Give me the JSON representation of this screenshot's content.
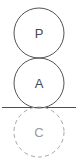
{
  "diagram": {
    "canvas": {
      "width": 78,
      "height": 166,
      "background": "#ffffff"
    },
    "ground_line": {
      "name": "ground-line",
      "x1": 2,
      "x2": 76,
      "y": 107,
      "color": "#4d4d4d",
      "style": "solid"
    },
    "circles": [
      {
        "id": "circle-p",
        "label": "P",
        "cx": 39,
        "cy": 33,
        "r": 25,
        "style": "solid",
        "stroke": "#545454",
        "label_color": "#4a4a4a"
      },
      {
        "id": "circle-a",
        "label": "A",
        "cx": 39,
        "cy": 83,
        "r": 25,
        "style": "solid",
        "stroke": "#545454",
        "label_color": "#4a4a4a"
      },
      {
        "id": "circle-c",
        "label": "C",
        "cx": 39,
        "cy": 132,
        "r": 25,
        "style": "dashed",
        "stroke": "#a6a6a6",
        "label_color": "#9a9a9a"
      }
    ]
  }
}
